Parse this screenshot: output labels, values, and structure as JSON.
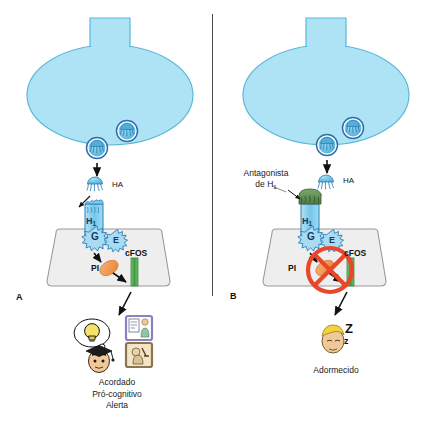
{
  "figure": {
    "background": "#ffffff",
    "divider_color": "#4a4a4a"
  },
  "colors": {
    "neuron_fill": "#ade3f5",
    "neuron_stroke": "#5bb7d8",
    "vesicle_fill": "#6fc5e8",
    "vesicle_stroke": "#2e6fa8",
    "histamine_fill": "#5bbfe6",
    "histamine_stroke": "#2f7fae",
    "receptor_fill": "#8fd4ef",
    "receptor_stroke": "#2b7fb5",
    "gprotein_fill": "#a9dcf2",
    "postsynaptic_fill": "#eeeeee",
    "postsynaptic_stroke": "#9a9a9a",
    "pi_orange": "#f0924a",
    "cfos_green": "#4aa84a",
    "antagonist_green": "#5f8f52",
    "block_red": "#e8472a",
    "arrow_black": "#111111",
    "text": "#1a1a1a"
  },
  "panels": [
    {
      "id": "A",
      "letter": "A",
      "neurotransmitter_label": "HA",
      "receptor_label": "H",
      "receptor_subscript": "1",
      "gprotein_label": "G",
      "effector_label": "E",
      "second_messenger_label": "PI",
      "gene_label": "cFOS",
      "antagonist_label": null,
      "blocked": false,
      "outcome_lines": [
        "Acordado",
        "Pró-cognitivo",
        "Alerta"
      ],
      "outcome_icons": [
        "graduate-face-icon",
        "lightbulb-thought-icon",
        "document-person-icon",
        "microscope-person-icon"
      ]
    },
    {
      "id": "B",
      "letter": "B",
      "neurotransmitter_label": "HA",
      "receptor_label": "H",
      "receptor_subscript": "1",
      "gprotein_label": "G",
      "effector_label": "E",
      "second_messenger_label": "PI",
      "gene_label": "cFOS",
      "antagonist_label_lines": [
        "Antagonista",
        "de H"
      ],
      "antagonist_subscript": "1",
      "blocked": true,
      "outcome_lines": [
        "Adormecido"
      ],
      "outcome_icons": [
        "sleepy-face-icon",
        "zzz-icon"
      ]
    }
  ]
}
